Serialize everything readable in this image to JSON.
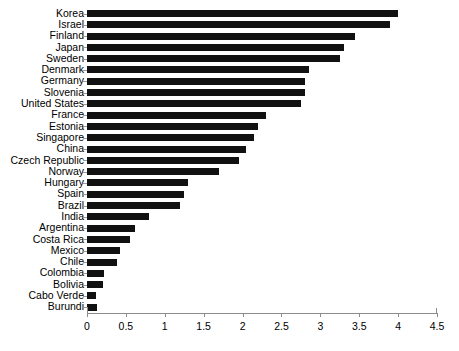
{
  "chart_data": {
    "type": "bar",
    "orientation": "horizontal",
    "title": "",
    "xlabel": "",
    "ylabel": "",
    "xlim": [
      0,
      4.5
    ],
    "xticks": [
      "0",
      "0.5",
      "1",
      "1.5",
      "2",
      "2.5",
      "3",
      "3.5",
      "4",
      "4.5"
    ],
    "xtick_values": [
      0,
      0.5,
      1,
      1.5,
      2,
      2.5,
      3,
      3.5,
      4,
      4.5
    ],
    "grid": false,
    "legend": false,
    "bar_color": "#111111",
    "axis_color": "#8c8c8c",
    "categories": [
      "Korea",
      "Israel",
      "Finland",
      "Japan",
      "Sweden",
      "Denmark",
      "Germany",
      "Slovenia",
      "United States",
      "France",
      "Estonia",
      "Singapore",
      "China",
      "Czech Republic",
      "Norway",
      "Hungary",
      "Spain",
      "Brazil",
      "India",
      "Argentina",
      "Costa Rica",
      "Mexico",
      "Chile",
      "Colombia",
      "Bolivia",
      "Cabo Verde",
      "Burundi"
    ],
    "values": [
      4.0,
      3.9,
      3.45,
      3.3,
      3.25,
      2.85,
      2.8,
      2.8,
      2.75,
      2.3,
      2.2,
      2.15,
      2.05,
      1.95,
      1.7,
      1.3,
      1.25,
      1.2,
      0.8,
      0.62,
      0.55,
      0.42,
      0.38,
      0.22,
      0.2,
      0.12,
      0.13
    ]
  }
}
